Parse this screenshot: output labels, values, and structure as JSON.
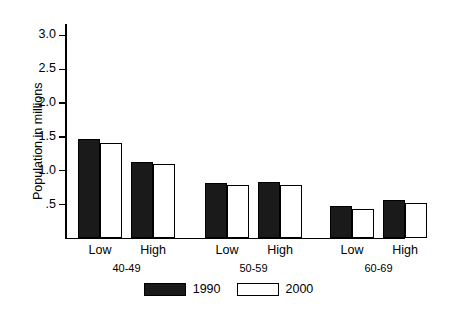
{
  "chart_data": {
    "type": "bar",
    "title": "",
    "xlabel": "",
    "ylabel": "Population in millions",
    "ylim": [
      0,
      3.15
    ],
    "grid": false,
    "legend_position": "bottom-center",
    "ytick_labels": [
      "3.0",
      "2.5",
      "2.0",
      "1.5",
      "1.0",
      ".5"
    ],
    "ytick_values": [
      3.0,
      2.5,
      2.0,
      1.5,
      1.0,
      0.5
    ],
    "groups": [
      "40-49",
      "50-59",
      "60-69"
    ],
    "categories": [
      "Low",
      "High",
      "Low",
      "High",
      "Low",
      "High"
    ],
    "series": [
      {
        "name": "1990",
        "color": "#1a1a1a",
        "values": [
          1.46,
          1.12,
          0.81,
          0.82,
          0.47,
          0.56
        ]
      },
      {
        "name": "2000",
        "color": "#ffffff",
        "values": [
          1.4,
          1.09,
          0.78,
          0.78,
          0.43,
          0.52
        ]
      }
    ]
  },
  "axis": {
    "y_title": "Population in millions",
    "ticks": [
      {
        "label": "3.0",
        "value": 3.0
      },
      {
        "label": "2.5",
        "value": 2.5
      },
      {
        "label": "2.0",
        "value": 2.0
      },
      {
        "label": "1.5",
        "value": 1.5
      },
      {
        "label": "1.0",
        "value": 1.0
      },
      {
        "label": ".5",
        "value": 0.5
      }
    ]
  },
  "xaxis": {
    "cat_labels": [
      "Low",
      "High",
      "Low",
      "High",
      "Low",
      "High"
    ],
    "group_labels": [
      "40-49",
      "50-59",
      "60-69"
    ]
  },
  "legend": {
    "items": [
      {
        "label": "1990",
        "style": "fill-black"
      },
      {
        "label": "2000",
        "style": "fill-white"
      }
    ]
  }
}
